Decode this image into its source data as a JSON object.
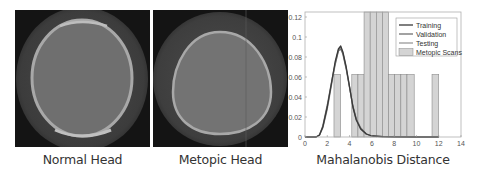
{
  "panels": [
    {
      "caption": "Normal Head"
    },
    {
      "caption": "Metopic Head"
    },
    {
      "caption": "Mahalanobis Distance"
    }
  ],
  "chart_data": {
    "type": "bar+line",
    "title": "",
    "xlabel": "Mahalanobis Distance",
    "ylabel": "",
    "xlim": [
      0,
      14
    ],
    "ylim": [
      0,
      0.125
    ],
    "xticks": [
      "0",
      "2",
      "4",
      "6",
      "8",
      "10",
      "12",
      "14"
    ],
    "yticks": [
      "0",
      "0.02",
      "0.04",
      "0.06",
      "0.08",
      "0.1",
      "0.12"
    ],
    "grid": false,
    "legend_position": "upper right",
    "legend": [
      "Training",
      "Validation",
      "Testing",
      "Metopic Scans"
    ],
    "histogram": {
      "name": "Metopic Scans",
      "bins": [
        {
          "x0": 2.6,
          "x1": 3.2,
          "value": 0.0625
        },
        {
          "x0": 4.2,
          "x1": 4.75,
          "value": 0.0625
        },
        {
          "x0": 4.75,
          "x1": 5.3,
          "value": 0.0625
        },
        {
          "x0": 5.3,
          "x1": 5.85,
          "value": 0.125
        },
        {
          "x0": 5.85,
          "x1": 6.4,
          "value": 0.125
        },
        {
          "x0": 6.4,
          "x1": 6.95,
          "value": 0.125
        },
        {
          "x0": 6.95,
          "x1": 7.5,
          "value": 0.125
        },
        {
          "x0": 7.5,
          "x1": 8.05,
          "value": 0.0625
        },
        {
          "x0": 8.05,
          "x1": 8.6,
          "value": 0.0625
        },
        {
          "x0": 8.6,
          "x1": 9.15,
          "value": 0.0625
        },
        {
          "x0": 9.15,
          "x1": 9.8,
          "value": 0.0625
        },
        {
          "x0": 11.4,
          "x1": 12.0,
          "value": 0.0625
        }
      ]
    },
    "series": [
      {
        "name": "Training",
        "color": "#3a3a3a",
        "x": [
          0,
          1.0,
          1.3,
          1.6,
          2.0,
          2.4,
          2.7,
          3.0,
          3.2,
          3.4,
          3.7,
          4.0,
          4.3,
          4.6,
          5.0,
          5.5,
          6.0,
          7.0,
          8.0,
          10.0,
          12.0
        ],
        "y": [
          0,
          0,
          0.002,
          0.01,
          0.03,
          0.055,
          0.075,
          0.088,
          0.091,
          0.085,
          0.07,
          0.05,
          0.03,
          0.017,
          0.008,
          0.003,
          0.001,
          0.0004,
          0.0002,
          0,
          0
        ]
      },
      {
        "name": "Validation",
        "color": "#707070",
        "x": [
          0,
          1.0,
          1.3,
          1.6,
          2.0,
          2.4,
          2.7,
          3.0,
          3.2,
          3.4,
          3.7,
          4.0,
          4.3,
          4.6,
          5.0,
          5.5,
          6.0,
          7.0,
          8.0,
          10.0,
          12.0
        ],
        "y": [
          0,
          0,
          0.002,
          0.011,
          0.032,
          0.056,
          0.073,
          0.086,
          0.088,
          0.083,
          0.068,
          0.049,
          0.031,
          0.018,
          0.009,
          0.003,
          0.001,
          0.0004,
          0.0002,
          0,
          0
        ]
      },
      {
        "name": "Testing",
        "color": "#9a9a9a",
        "x": [
          0,
          1.0,
          1.3,
          1.6,
          2.0,
          2.4,
          2.7,
          3.0,
          3.2,
          3.4,
          3.7,
          4.0,
          4.3,
          4.6,
          5.0,
          5.5,
          6.0,
          7.0,
          8.0,
          10.0,
          12.0
        ],
        "y": [
          0,
          0,
          0.002,
          0.009,
          0.028,
          0.053,
          0.072,
          0.087,
          0.09,
          0.084,
          0.069,
          0.05,
          0.03,
          0.017,
          0.008,
          0.003,
          0.001,
          0.0004,
          0.0002,
          0,
          0
        ]
      }
    ],
    "colors": {
      "bar_fill": "#d4d4d4",
      "bar_edge": "#8a8a8a",
      "axis": "#888888"
    }
  }
}
